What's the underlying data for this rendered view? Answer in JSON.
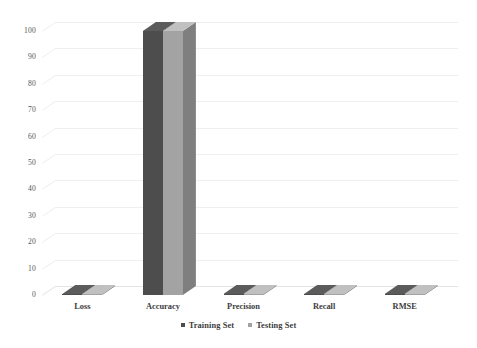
{
  "chart_data": {
    "type": "bar",
    "title": "",
    "subtitle": "",
    "xlabel": "",
    "ylabel": "",
    "categories": [
      "Loss",
      "Accuracy",
      "Precision",
      "Recall",
      "RMSE"
    ],
    "series": [
      {
        "name": "Training Set",
        "color": "#4d4d4d",
        "values": [
          0.4,
          100,
          0.4,
          0.4,
          0.4
        ]
      },
      {
        "name": "Testing Set",
        "color": "#a3a3a3",
        "values": [
          0.4,
          100,
          0.4,
          0.4,
          0.4
        ]
      }
    ],
    "ylim": [
      0,
      100
    ],
    "ytick_values": [
      0,
      10,
      20,
      30,
      40,
      50,
      60,
      70,
      80,
      90,
      100
    ],
    "ytick_labels": [
      "0",
      "10",
      "20",
      "30",
      "40",
      "50",
      "60",
      "70",
      "80",
      "90",
      "100"
    ],
    "grid": true,
    "grid_color": "#efefef",
    "legend_position": "bottom",
    "style": "3d-column",
    "background": "#ffffff"
  },
  "legend": {
    "entries": [
      {
        "label": "Training Set",
        "color": "#4d4d4d"
      },
      {
        "label": "Testing Set",
        "color": "#a3a3a3"
      }
    ]
  }
}
